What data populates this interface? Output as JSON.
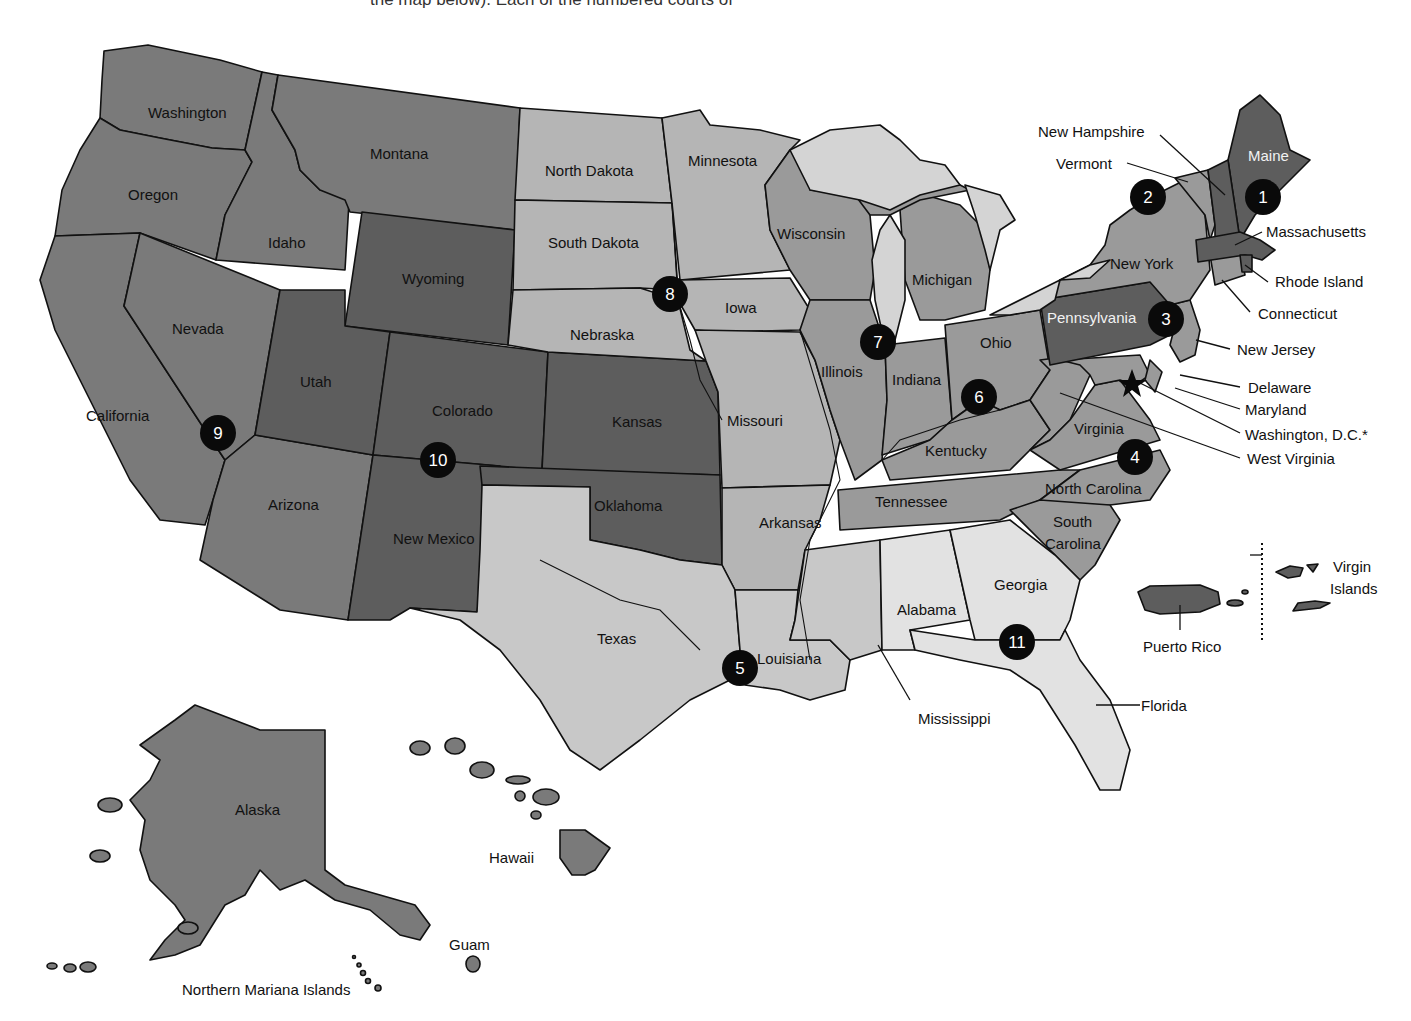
{
  "caption_fragment": "the map below). Each of the numbered courts of",
  "colors": {
    "darkest": "#5d5d5d",
    "dark": "#7a7a7a",
    "medium": "#9a9a9a",
    "light": "#b5b5b5",
    "lightest": "#d9d9d9",
    "water": "#d4d4d4",
    "circle": "#0a0a0a"
  },
  "states": {
    "washington": "Washington",
    "oregon": "Oregon",
    "california": "California",
    "idaho": "Idaho",
    "nevada": "Nevada",
    "montana": "Montana",
    "wyoming": "Wyoming",
    "utah": "Utah",
    "colorado": "Colorado",
    "arizona": "Arizona",
    "new_mexico": "New Mexico",
    "north_dakota": "North Dakota",
    "south_dakota": "South Dakota",
    "nebraska": "Nebraska",
    "kansas": "Kansas",
    "oklahoma": "Oklahoma",
    "texas": "Texas",
    "minnesota": "Minnesota",
    "iowa": "Iowa",
    "missouri": "Missouri",
    "arkansas": "Arkansas",
    "louisiana": "Louisiana",
    "wisconsin": "Wisconsin",
    "illinois": "Illinois",
    "michigan": "Michigan",
    "indiana": "Indiana",
    "ohio": "Ohio",
    "kentucky": "Kentucky",
    "tennessee": "Tennessee",
    "mississippi": "Mississippi",
    "alabama": "Alabama",
    "georgia": "Georgia",
    "florida": "Florida",
    "south_carolina_1": "South",
    "south_carolina_2": "Carolina",
    "north_carolina": "North Carolina",
    "virginia": "Virginia",
    "west_virginia": "West Virginia",
    "maryland": "Maryland",
    "delaware": "Delaware",
    "washington_dc": "Washington, D.C.*",
    "pennsylvania": "Pennsylvania",
    "new_jersey": "New Jersey",
    "new_york": "New York",
    "connecticut": "Connecticut",
    "rhode_island": "Rhode Island",
    "massachusetts": "Massachusetts",
    "vermont": "Vermont",
    "new_hampshire": "New Hampshire",
    "maine": "Maine"
  },
  "territories": {
    "alaska": "Alaska",
    "hawaii": "Hawaii",
    "guam": "Guam",
    "northern_mariana": "Northern Mariana Islands",
    "puerto_rico": "Puerto Rico",
    "virgin_islands_1": "Virgin",
    "virgin_islands_2": "Islands"
  },
  "circuits": [
    {
      "number": "1",
      "x": 1263,
      "y": 197
    },
    {
      "number": "2",
      "x": 1148,
      "y": 197
    },
    {
      "number": "3",
      "x": 1166,
      "y": 319
    },
    {
      "number": "4",
      "x": 1135,
      "y": 457
    },
    {
      "number": "5",
      "x": 740,
      "y": 668
    },
    {
      "number": "6",
      "x": 979,
      "y": 397
    },
    {
      "number": "7",
      "x": 878,
      "y": 342
    },
    {
      "number": "8",
      "x": 670,
      "y": 294
    },
    {
      "number": "9",
      "x": 218,
      "y": 433
    },
    {
      "number": "10",
      "x": 438,
      "y": 460
    },
    {
      "number": "11",
      "x": 1017,
      "y": 642
    }
  ],
  "dc_marker": "star-icon"
}
